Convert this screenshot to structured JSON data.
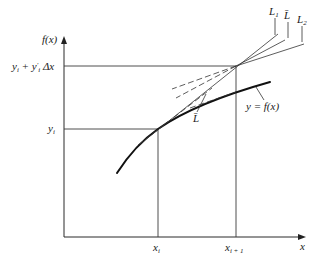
{
  "diagram": {
    "type": "euler-method-slope-averaging",
    "axes": {
      "y_label": "f(x)",
      "x_label": "x"
    },
    "y_ticks": [
      {
        "id": "yi_plus",
        "main": "y",
        "sub": "i",
        "rest": " + y",
        "prime_sub": "i",
        "tail": " Δx"
      },
      {
        "id": "yi",
        "main": "y",
        "sub": "i"
      }
    ],
    "x_ticks": [
      {
        "id": "xi",
        "main": "x",
        "sub": "i"
      },
      {
        "id": "xi1",
        "main": "x",
        "sub": "i + 1"
      }
    ],
    "lines": [
      {
        "id": "L1",
        "label": "L",
        "sub": "1"
      },
      {
        "id": "Lbar_top",
        "label": "L̄"
      },
      {
        "id": "L2",
        "label": "L",
        "sub": "2"
      },
      {
        "id": "Lbar_mid",
        "label": "L̄"
      }
    ],
    "curve_label": "y = f(x)",
    "colors": {
      "ink": "#1a1a1a",
      "background": "#ffffff"
    }
  }
}
